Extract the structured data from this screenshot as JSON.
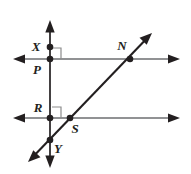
{
  "figure": {
    "type": "geometry-diagram",
    "background_color": "#ffffff",
    "line_color": "#231f20",
    "secondary_line_color": "#6d6e71",
    "right_angle_marker_color": "#8c8c8c",
    "point_color": "#231f20"
  },
  "labels": {
    "x": "X",
    "p": "P",
    "n": "N",
    "r": "R",
    "s": "S",
    "y": "Y"
  },
  "points": [
    {
      "id": "x",
      "label": "X",
      "cx": 50,
      "cy": 47,
      "label_x": 36,
      "label_y": 50
    },
    {
      "id": "p",
      "label": "P",
      "cx": 50,
      "cy": 59,
      "label_x": 36,
      "label_y": 74
    },
    {
      "id": "n",
      "label": "N",
      "cx": 130,
      "cy": 59,
      "label_x": 119,
      "label_y": 50
    },
    {
      "id": "r",
      "label": "R",
      "cx": 50,
      "cy": 118,
      "label_x": 35,
      "label_y": 112
    },
    {
      "id": "s",
      "label": "S",
      "cx": 70,
      "cy": 118,
      "label_x": 72,
      "label_y": 133
    },
    {
      "id": "y",
      "label": "Y",
      "cx": 50,
      "cy": 140,
      "label_x": 54,
      "label_y": 153
    }
  ],
  "lines": [
    {
      "id": "vertical-line-xy",
      "name": "line XY",
      "x1": 50,
      "y1": 20,
      "x2": 50,
      "y2": 168,
      "arrows": "both"
    },
    {
      "id": "top-horizontal-line-pn",
      "name": "line PN",
      "x1": 13,
      "y1": 59,
      "x2": 180,
      "y2": 59,
      "arrows": "both"
    },
    {
      "id": "bottom-horizontal-line-rs",
      "name": "line RS",
      "x1": 13,
      "y1": 118,
      "x2": 180,
      "y2": 118,
      "arrows": "both"
    },
    {
      "id": "diagonal-transversal-ns",
      "name": "transversal through N and S",
      "x1": 28,
      "y1": 162,
      "x2": 152,
      "y2": 33,
      "arrows": "both"
    }
  ],
  "right_angles": [
    {
      "id": "right-angle-at-p",
      "vertex": "P",
      "x": 52,
      "y": 48,
      "size": 9
    },
    {
      "id": "right-angle-at-r",
      "vertex": "R",
      "x": 52,
      "y": 107,
      "size": 9
    }
  ]
}
